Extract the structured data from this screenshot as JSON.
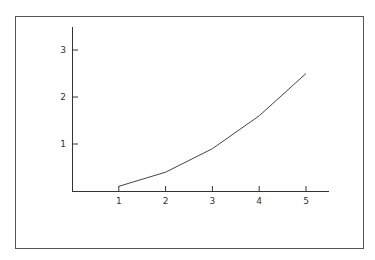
{
  "chart_data": {
    "type": "line",
    "title": "",
    "xlabel": "",
    "ylabel": "",
    "x": [
      1,
      2,
      3,
      4,
      5
    ],
    "series": [
      {
        "name": "series-1",
        "values": [
          0.1,
          0.4,
          0.9,
          1.6,
          2.5
        ]
      }
    ],
    "x_ticks": [
      "1",
      "2",
      "3",
      "4",
      "5"
    ],
    "y_ticks": [
      "1",
      "2",
      "3"
    ],
    "xlim": [
      0,
      5.5
    ],
    "ylim": [
      0,
      3.5
    ],
    "grid": false,
    "legend": null
  },
  "colors": {
    "line": "#444444",
    "axis": "#333333",
    "frame": "#555555"
  }
}
